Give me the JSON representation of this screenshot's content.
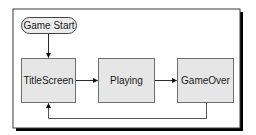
{
  "diagram": {
    "type": "state-flow",
    "colors": {
      "frame_border": "#3a3a3a",
      "frame_shadow": "#000000",
      "node_fill": "#e6e6e6",
      "node_border": "#6e6e6e",
      "start_fill": "#ececec",
      "edge": "#2a2a2a",
      "return_edge": "#555555"
    },
    "nodes": [
      {
        "id": "start",
        "label": "Game Start",
        "shape": "pill"
      },
      {
        "id": "title",
        "label": "TitleScreen",
        "shape": "box"
      },
      {
        "id": "playing",
        "label": "Playing",
        "shape": "box"
      },
      {
        "id": "gameover",
        "label": "GameOver",
        "shape": "box"
      }
    ],
    "edges": [
      {
        "from": "start",
        "to": "title"
      },
      {
        "from": "title",
        "to": "playing"
      },
      {
        "from": "playing",
        "to": "gameover"
      },
      {
        "from": "gameover",
        "to": "title",
        "route": "below"
      }
    ]
  }
}
